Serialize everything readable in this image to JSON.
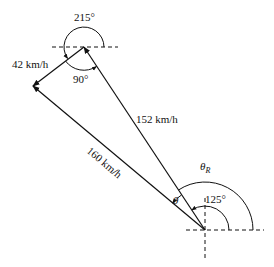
{
  "diagram": {
    "type": "vector-triangle",
    "vertices": {
      "top": {
        "x": 84,
        "y": 47
      },
      "left": {
        "x": 33,
        "y": 86
      },
      "bottom": {
        "x": 205,
        "y": 230
      }
    },
    "labels": {
      "angle_215": "215°",
      "angle_90": "90°",
      "speed_42": "42 km/h",
      "speed_152": "152 km/h",
      "speed_160": "160 km/h",
      "theta_R": "θ",
      "theta_R_sub": "R",
      "theta": "θ",
      "angle_125": "125°"
    },
    "vectors": [
      {
        "name": "velocity-152",
        "from": "bottom",
        "to": "top",
        "magnitude": "152 km/h",
        "direction_deg": 125
      },
      {
        "name": "velocity-42",
        "from": "top",
        "to": "left",
        "magnitude": "42 km/h",
        "direction_deg": 215
      },
      {
        "name": "resultant-160",
        "from": "bottom",
        "to": "left",
        "magnitude": "160 km/h",
        "direction_deg": "θR"
      }
    ],
    "colors": {
      "stroke": "#111111",
      "background": "#ffffff"
    }
  }
}
